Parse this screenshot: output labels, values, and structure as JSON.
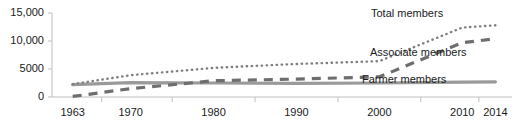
{
  "chart_data": {
    "type": "line",
    "title": "",
    "xlabel": "",
    "ylabel": "",
    "ylim": [
      0,
      15000
    ],
    "yticks": [
      0,
      5000,
      10000,
      15000
    ],
    "ytick_labels": [
      "0",
      "5000",
      "10,000",
      "15,000"
    ],
    "grid": false,
    "legend_position": "inline-right",
    "x": [
      1963,
      1970,
      1980,
      1990,
      2000,
      2010,
      2014
    ],
    "xtick_labels": [
      "1963",
      "1970",
      "1980",
      "1990",
      "2000",
      "2010",
      "2014"
    ],
    "series": [
      {
        "name": "Total members",
        "style": "dotted",
        "color": "#7f7f7f",
        "values": [
          2300,
          3900,
          5200,
          5900,
          6400,
          12400,
          12800
        ]
      },
      {
        "name": "Associate members",
        "style": "dashed",
        "color": "#6e6e6e",
        "values": [
          100,
          1500,
          2900,
          3200,
          3600,
          9700,
          10400
        ]
      },
      {
        "name": "Farmer members",
        "style": "solid",
        "color": "#9a9a9a",
        "values": [
          2200,
          2550,
          2500,
          2450,
          2500,
          2650,
          2700
        ]
      }
    ]
  },
  "axis": {
    "line_color": "#bfbfbf",
    "tick_color": "#bfbfbf"
  },
  "labels": {
    "total": "Total members",
    "associate": "Associate members",
    "farmer": "Farmer members"
  }
}
